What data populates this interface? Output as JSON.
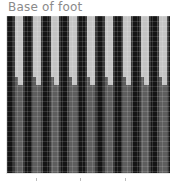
{
  "title": "Base of foot",
  "colors": {
    "stripe": "#151515",
    "upper": "#c4c4c4",
    "lower": "#5e5e5e",
    "title": "#8a8a8a"
  },
  "chart_data": {
    "type": "heatmap",
    "title": "Base of foot",
    "xlabel": "",
    "ylabel": "",
    "grid": true,
    "stripes": 9,
    "stripe_period_px": 18,
    "upper_band_end_fraction": 0.44,
    "x_ticks": [
      "",
      "",
      ""
    ],
    "x_tick_positions_px": [
      36,
      80,
      125
    ]
  }
}
